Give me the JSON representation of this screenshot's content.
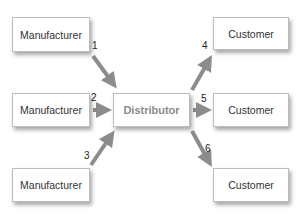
{
  "manufacturers": [
    {
      "label": "Manufacturer"
    },
    {
      "label": "Manufacturer"
    },
    {
      "label": "Manufacturer"
    }
  ],
  "distributor": {
    "label": "Distributor"
  },
  "customers": [
    {
      "label": "Customer"
    },
    {
      "label": "Customer"
    },
    {
      "label": "Customer"
    }
  ],
  "edges": [
    {
      "from": "manufacturer-1",
      "to": "distributor",
      "label": "1"
    },
    {
      "from": "manufacturer-2",
      "to": "distributor",
      "label": "2"
    },
    {
      "from": "manufacturer-3",
      "to": "distributor",
      "label": "3"
    },
    {
      "from": "distributor",
      "to": "customer-1",
      "label": "4"
    },
    {
      "from": "distributor",
      "to": "customer-2",
      "label": "5"
    },
    {
      "from": "distributor",
      "to": "customer-3",
      "label": "6"
    }
  ],
  "colors": {
    "arrow": "#8c8c8c",
    "box_border": "#bdbdbd",
    "distributor_text": "#8a8a8a"
  }
}
